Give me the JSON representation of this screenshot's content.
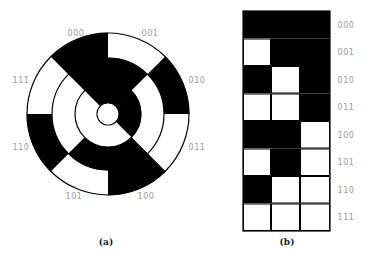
{
  "figure": {
    "colors": {
      "zero": "#000000",
      "one": "#ffffff",
      "stroke": "#000000",
      "label": "#9a9a9a"
    },
    "disk": {
      "caption": "(a)",
      "center": [
        108,
        114
      ],
      "radii": {
        "outer": 81,
        "middle": 56,
        "inner": 33,
        "hole": 11
      },
      "sector_labels": [
        "000",
        "001",
        "010",
        "011",
        "100",
        "101",
        "110",
        "111"
      ],
      "rings": {
        "outer_lsb": [
          0,
          1,
          0,
          1,
          0,
          1,
          0,
          1
        ],
        "middle_bit": [
          0,
          0,
          1,
          1,
          0,
          0,
          1,
          1
        ],
        "inner_msb": [
          0,
          0,
          0,
          0,
          1,
          1,
          1,
          1
        ]
      }
    },
    "strip": {
      "caption": "(b)",
      "row_labels": [
        "000",
        "001",
        "010",
        "011",
        "100",
        "101",
        "110",
        "111"
      ],
      "columns": {
        "left_lsb": [
          0,
          1,
          0,
          1,
          0,
          1,
          0,
          1
        ],
        "middle_bit": [
          0,
          0,
          1,
          1,
          0,
          0,
          1,
          1
        ],
        "right_msb": [
          0,
          0,
          0,
          0,
          1,
          1,
          1,
          1
        ]
      }
    }
  }
}
